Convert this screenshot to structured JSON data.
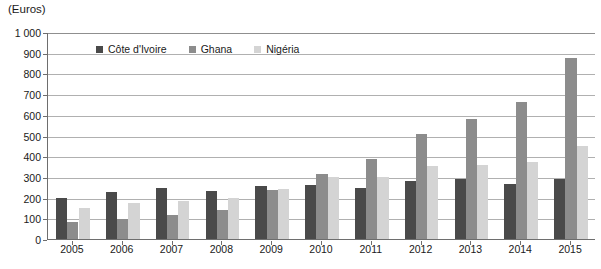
{
  "chart_data": {
    "type": "bar",
    "title": "",
    "unit_caption": "(Euros)",
    "xlabel": "",
    "ylabel": "",
    "ylim": [
      0,
      1000
    ],
    "ytick_step": 100,
    "grid": true,
    "legend_position": "inside-top-left",
    "categories": [
      "2005",
      "2006",
      "2007",
      "2008",
      "2009",
      "2010",
      "2011",
      "2012",
      "2013",
      "2014",
      "2015"
    ],
    "ytick_labels": [
      "0",
      "100",
      "200",
      "300",
      "400",
      "500",
      "600",
      "700",
      "800",
      "900",
      "1 000"
    ],
    "series": [
      {
        "name": "Côte d'Ivoire",
        "color": "#4a4a4a",
        "values": [
          200,
          228,
          245,
          230,
          258,
          260,
          245,
          278,
          288,
          265,
          290
        ]
      },
      {
        "name": "Ghana",
        "color": "#8c8c8c",
        "values": [
          82,
          98,
          118,
          140,
          238,
          315,
          388,
          508,
          578,
          660,
          875
        ]
      },
      {
        "name": "Nigéria",
        "color": "#d4d4d4",
        "values": [
          152,
          172,
          185,
          200,
          243,
          298,
          298,
          352,
          358,
          370,
          450
        ]
      }
    ]
  }
}
